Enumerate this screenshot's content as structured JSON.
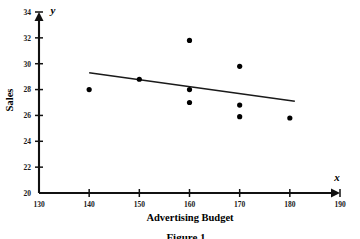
{
  "figure": {
    "caption": "Figure 1"
  },
  "chart_data": {
    "type": "scatter",
    "title": "",
    "xlabel": "Advertising Budget",
    "ylabel": "Sales",
    "x_axis_variable": "x",
    "y_axis_variable": "y",
    "xlim": [
      130,
      190
    ],
    "ylim": [
      20,
      34
    ],
    "xticks": [
      130,
      140,
      150,
      160,
      170,
      180,
      190
    ],
    "yticks": [
      20,
      22,
      24,
      26,
      28,
      30,
      32,
      34
    ],
    "xtick_labels": [
      "130",
      "140",
      "150",
      "160",
      "170",
      "180",
      "190"
    ],
    "ytick_labels": [
      "20",
      "22",
      "24",
      "26",
      "28",
      "30",
      "32",
      "34"
    ],
    "grid": false,
    "legend": false,
    "marker_color": "#000000",
    "line_color": "#1a1a1a",
    "points": [
      {
        "x": 140,
        "y": 28.0
      },
      {
        "x": 150,
        "y": 28.8
      },
      {
        "x": 160,
        "y": 31.8
      },
      {
        "x": 160,
        "y": 28.0
      },
      {
        "x": 160,
        "y": 27.0
      },
      {
        "x": 170,
        "y": 29.8
      },
      {
        "x": 170,
        "y": 26.8
      },
      {
        "x": 170,
        "y": 25.9
      },
      {
        "x": 180,
        "y": 25.8
      }
    ],
    "trend_line": {
      "x_start": 140,
      "y_start": 29.3,
      "x_end": 181,
      "y_end": 27.1
    }
  }
}
